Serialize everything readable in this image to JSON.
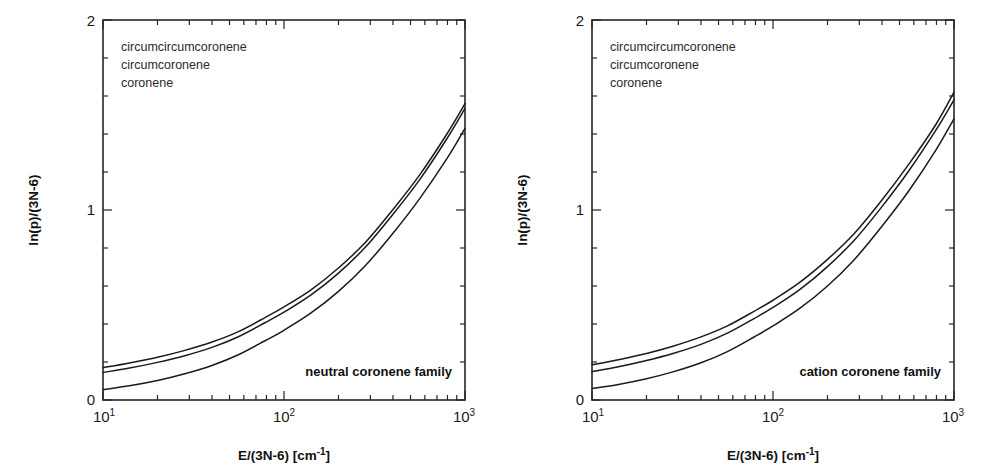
{
  "figure": {
    "background_color": "#ffffff",
    "axis_color": "#262626",
    "curve_color": "#1a1a1a"
  },
  "chart_data": [
    {
      "type": "line",
      "panel": "left",
      "title": "",
      "annotation": "neutral coronene family",
      "xlabel": "E/(3N-6)  [cm-1]",
      "xlabel_parts": {
        "base": "E/(3N-6)  [cm",
        "sup": "-1",
        "tail": "]"
      },
      "ylabel": "ln(p)/(3N-6)",
      "xscale": "log",
      "xlim": [
        10,
        1000
      ],
      "ylim": [
        0,
        2
      ],
      "xticks": [
        10,
        100,
        1000
      ],
      "xticklabels": [
        "10¹",
        "10²",
        "10³"
      ],
      "xtick_mantissas": [
        "10",
        "10",
        "10"
      ],
      "xtick_exponents": [
        "1",
        "2",
        "3"
      ],
      "yticks": [
        0,
        1,
        2
      ],
      "yticklabels": [
        "0",
        "1",
        "2"
      ],
      "yminorticks": [
        0.2,
        0.4,
        0.6,
        0.8,
        1.2,
        1.4,
        1.6,
        1.8
      ],
      "grid": false,
      "legend_position": "upper-left-inside",
      "legend": [
        "circumcircumcoronene",
        "circumcoronene",
        "coronene"
      ],
      "x": [
        10,
        14,
        20,
        28,
        40,
        56,
        79,
        100,
        141,
        200,
        282,
        398,
        562,
        794,
        1000
      ],
      "series": [
        {
          "name": "circumcircumcoronene",
          "values": [
            0.17,
            0.195,
            0.225,
            0.26,
            0.305,
            0.36,
            0.435,
            0.49,
            0.58,
            0.695,
            0.83,
            1.0,
            1.185,
            1.4,
            1.56
          ]
        },
        {
          "name": "circumcoronene",
          "values": [
            0.145,
            0.168,
            0.198,
            0.232,
            0.277,
            0.333,
            0.408,
            0.462,
            0.553,
            0.668,
            0.805,
            0.975,
            1.16,
            1.375,
            1.535
          ]
        },
        {
          "name": "coronene",
          "values": [
            0.055,
            0.075,
            0.103,
            0.137,
            0.182,
            0.238,
            0.313,
            0.367,
            0.458,
            0.572,
            0.708,
            0.875,
            1.06,
            1.27,
            1.43
          ]
        }
      ]
    },
    {
      "type": "line",
      "panel": "right",
      "title": "",
      "annotation": "cation coronene family",
      "xlabel": "E/(3N-6)  [cm-1]",
      "xlabel_parts": {
        "base": "E/(3N-6)  [cm",
        "sup": "-1",
        "tail": "]"
      },
      "ylabel": "ln(p)/(3N-6)",
      "xscale": "log",
      "xlim": [
        10,
        1000
      ],
      "ylim": [
        0,
        2
      ],
      "xticks": [
        10,
        100,
        1000
      ],
      "xticklabels": [
        "10¹",
        "10²",
        "10³"
      ],
      "xtick_mantissas": [
        "10",
        "10",
        "10"
      ],
      "xtick_exponents": [
        "1",
        "2",
        "3"
      ],
      "yticks": [
        0,
        1,
        2
      ],
      "yticklabels": [
        "0",
        "1",
        "2"
      ],
      "yminorticks": [
        0.2,
        0.4,
        0.6,
        0.8,
        1.2,
        1.4,
        1.6,
        1.8
      ],
      "grid": false,
      "legend_position": "upper-left-inside",
      "legend": [
        "circumcircumcoronene",
        "circumcoronene",
        "coronene"
      ],
      "x": [
        10,
        14,
        20,
        28,
        40,
        56,
        79,
        100,
        141,
        200,
        282,
        398,
        562,
        794,
        1000
      ],
      "series": [
        {
          "name": "circumcircumcoronene",
          "values": [
            0.185,
            0.212,
            0.245,
            0.283,
            0.332,
            0.39,
            0.468,
            0.525,
            0.62,
            0.74,
            0.878,
            1.05,
            1.24,
            1.45,
            1.62
          ]
        },
        {
          "name": "circumcoronene",
          "values": [
            0.15,
            0.175,
            0.208,
            0.245,
            0.293,
            0.352,
            0.43,
            0.487,
            0.582,
            0.702,
            0.842,
            1.015,
            1.205,
            1.42,
            1.58
          ]
        },
        {
          "name": "coronene",
          "values": [
            0.06,
            0.082,
            0.112,
            0.148,
            0.196,
            0.255,
            0.333,
            0.39,
            0.483,
            0.6,
            0.74,
            0.912,
            1.1,
            1.315,
            1.48
          ]
        }
      ]
    }
  ]
}
